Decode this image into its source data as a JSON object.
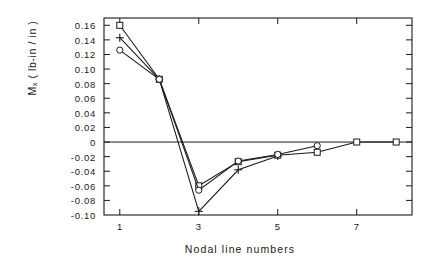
{
  "chart_data": {
    "type": "line",
    "title": "",
    "xlabel": "Nodal line numbers",
    "ylabel": "Mₓ ( lb-in / in )",
    "x": [
      1,
      2,
      3,
      4,
      5,
      6,
      7,
      8
    ],
    "xlim": [
      0.6,
      8.4
    ],
    "ylim": [
      -0.1,
      0.17
    ],
    "xticks": [
      1,
      3,
      5,
      7
    ],
    "xtick_labels": [
      "1",
      "3",
      "5",
      "7"
    ],
    "yticks": [
      0.16,
      0.14,
      0.12,
      0.1,
      0.08,
      0.06,
      0.04,
      0.02,
      0,
      -0.02,
      -0.04,
      -0.06,
      -0.08,
      -0.1
    ],
    "ytick_labels": [
      "0.16",
      "0.14",
      "0.12",
      "0.10",
      "0.08",
      "0.06",
      "0.04",
      "0.02",
      "0",
      "-0.02",
      "-0.04",
      "-0.06",
      "-0.08",
      "-0.10"
    ],
    "grid": false,
    "legend": "none",
    "zero_line": 0,
    "series": [
      {
        "name": "series-square",
        "marker": "square",
        "values": [
          0.16,
          0.086,
          -0.06,
          -0.027,
          -0.018,
          -0.014,
          0.0,
          0.0
        ]
      },
      {
        "name": "series-plus",
        "marker": "plus",
        "values": [
          0.143,
          0.086,
          -0.095,
          -0.038,
          -0.019,
          null,
          null,
          null
        ]
      },
      {
        "name": "series-circle",
        "marker": "circle",
        "values": [
          0.126,
          0.086,
          -0.066,
          -0.026,
          -0.017,
          -0.005,
          null,
          null
        ]
      }
    ]
  },
  "axis": {
    "ytick_labels": [
      "0.16",
      "0.14",
      "0.12",
      "0.10",
      "0.08",
      "0.06",
      "0.04",
      "0.02",
      "0",
      "-0.02",
      "-0.04",
      "-0.06",
      "-0.08",
      "-0.10"
    ],
    "xtick_labels": [
      "1",
      "3",
      "5",
      "7"
    ],
    "y_axis_title": "Mₓ ( lb-in / in )",
    "x_axis_title": "Nodal line numbers"
  },
  "style": {
    "line_color": "#1a1a1a",
    "background": "#ffffff",
    "frame_color": "#1a1a1a"
  }
}
